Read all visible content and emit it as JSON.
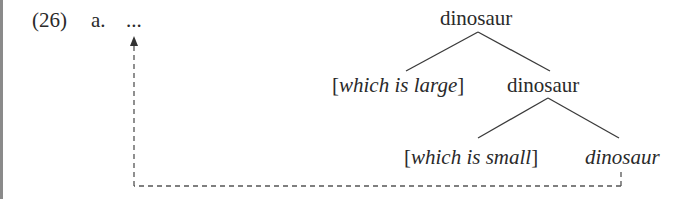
{
  "example": {
    "number": "(26)",
    "sub_label": "a.",
    "ellipsis": "..."
  },
  "tree": {
    "root": {
      "label": "dinosaur"
    },
    "level1": {
      "left": {
        "open_bracket": "[",
        "text": "which is large",
        "close_bracket": "]"
      },
      "right": {
        "label": "dinosaur"
      }
    },
    "level2": {
      "left": {
        "open_bracket": "[",
        "text": "which is small",
        "close_bracket": "]"
      },
      "right": {
        "label": "dinosaur",
        "style": "italic"
      }
    }
  },
  "movement_arrow": {
    "from": "level2.right (dinosaur)",
    "to": "ellipsis",
    "style": "dashed",
    "color": "#555555"
  },
  "colors": {
    "text": "#2a2a2a",
    "lines": "#3a3a3a",
    "edge_bar": "#8a8a8a",
    "background": "#ffffff"
  }
}
